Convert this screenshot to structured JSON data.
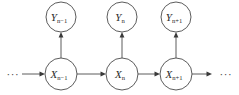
{
  "figure": {
    "background_color": "#ffffff",
    "stroke_color": "#4a4a4a",
    "label_color": "#2b2b2b"
  },
  "ellipsis": {
    "left": "···",
    "right": "···"
  },
  "hidden_nodes": [
    {
      "id": "x-prev",
      "base": "X",
      "sub": "n−1",
      "label": "X_{n-1}",
      "cx": 61,
      "cy": 74,
      "r": 16
    },
    {
      "id": "x-curr",
      "base": "X",
      "sub": "n",
      "label": "X_n",
      "cx": 122,
      "cy": 74,
      "r": 16
    },
    {
      "id": "x-next",
      "base": "X",
      "sub": "n+1",
      "label": "X_{n+1}",
      "cx": 176,
      "cy": 74,
      "r": 16
    }
  ],
  "observed_nodes": [
    {
      "id": "y-prev",
      "base": "Y",
      "sub": "n−1",
      "label": "Y_{n-1}",
      "cx": 61,
      "cy": 17,
      "r": 15
    },
    {
      "id": "y-curr",
      "base": "Y",
      "sub": "n",
      "label": "Y_n",
      "cx": 122,
      "cy": 17,
      "r": 15
    },
    {
      "id": "y-next",
      "base": "Y",
      "sub": "n+1",
      "label": "Y_{n+1}",
      "cx": 176,
      "cy": 17,
      "r": 15
    }
  ],
  "transition_edges": [
    {
      "id": "edge-in-left",
      "from": "ellipsis-left",
      "to": "x-prev",
      "direction": "right"
    },
    {
      "id": "edge-prev-curr",
      "from": "x-prev",
      "to": "x-curr",
      "direction": "right"
    },
    {
      "id": "edge-curr-next",
      "from": "x-curr",
      "to": "x-next",
      "direction": "right"
    },
    {
      "id": "edge-out-right",
      "from": "x-next",
      "to": "ellipsis-right",
      "direction": "right"
    }
  ],
  "emission_edges": [
    {
      "id": "emit-prev",
      "from": "x-prev",
      "to": "y-prev",
      "direction": "up"
    },
    {
      "id": "emit-curr",
      "from": "x-curr",
      "to": "y-curr",
      "direction": "up"
    },
    {
      "id": "emit-next",
      "from": "x-next",
      "to": "y-next",
      "direction": "up"
    }
  ]
}
